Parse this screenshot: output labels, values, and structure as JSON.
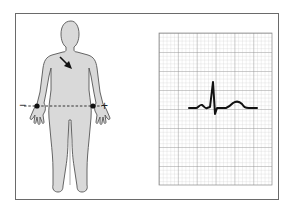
{
  "diagram": {
    "figure": {
      "electrodes": [
        {
          "position": "right-wrist",
          "polarity": "negative",
          "sign": "−"
        },
        {
          "position": "left-wrist",
          "polarity": "positive",
          "sign": "+"
        }
      ],
      "lead_line": "dashed",
      "heart_axis_arrow": "pointing down-right"
    },
    "ecg_strip": {
      "paper": "grid",
      "waveform": [
        "P wave",
        "QRS complex",
        "T wave"
      ],
      "qrs_polarity": "predominantly positive"
    },
    "colors": {
      "body_fill": "#d9d9d9",
      "body_outline": "#555555",
      "grid_minor": "#c4c4c4",
      "grid_major": "#8a8a8a",
      "trace": "#111111",
      "frame": "#6a6a6a"
    }
  },
  "labels": {
    "negative": "−",
    "positive": "+"
  }
}
